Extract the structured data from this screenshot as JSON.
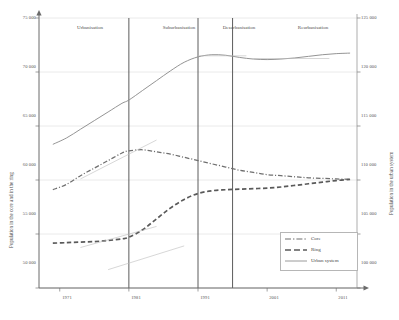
{
  "chart_data": {
    "type": "line",
    "title": "",
    "xlabel": "",
    "x_ticks": [
      "1971",
      "1981",
      "1991",
      "2001",
      "2011"
    ],
    "x_values": [
      1971,
      1981,
      1991,
      2001,
      2011
    ],
    "xlim": [
      1968,
      2014
    ],
    "grid": true,
    "legend_position": "inside-bottom-right",
    "axes": {
      "left": {
        "label": "Population in the core and in the ring",
        "ticks": [
          "50 000",
          "55 000",
          "60 000",
          "65 000",
          "70 000",
          "75 000"
        ],
        "tick_values": [
          50000,
          55000,
          60000,
          65000,
          70000,
          75000
        ],
        "ylim": [
          50000,
          75000
        ]
      },
      "right": {
        "label": "Population in the urban system",
        "ticks": [
          "100 000",
          "105 000",
          "110 000",
          "115 000",
          "120 000",
          "125 000"
        ],
        "tick_values": [
          100000,
          105000,
          110000,
          115000,
          120000,
          125000
        ],
        "ylim": [
          100000,
          125000
        ]
      }
    },
    "phases": [
      {
        "name": "Urbanisation",
        "start": 1968,
        "end": 1981
      },
      {
        "name": "Suburbanisation",
        "start": 1981,
        "end": 1991
      },
      {
        "name": "Desurbanisation",
        "start": 1991,
        "end": 1996
      },
      {
        "name": "Reurbanisation",
        "start": 1996,
        "end": 2014
      }
    ],
    "phase_dividers": [
      1981,
      1991,
      1996
    ],
    "series": [
      {
        "name": "Core",
        "axis": "left",
        "style": "dash-dot",
        "color": "#6f6f6f",
        "x": [
          1970,
          1972,
          1974,
          1976,
          1978,
          1980,
          1981,
          1983,
          1985,
          1987,
          1989,
          1991,
          1993,
          1995,
          1997,
          1999,
          2001,
          2003,
          2005,
          2007,
          2009,
          2011,
          2013
        ],
        "values": [
          59100,
          59600,
          60400,
          61100,
          61800,
          62500,
          62700,
          62800,
          62600,
          62400,
          62100,
          61800,
          61500,
          61200,
          60900,
          60700,
          60500,
          60400,
          60300,
          60200,
          60150,
          60100,
          60050
        ]
      },
      {
        "name": "Ring",
        "axis": "left",
        "style": "dashed",
        "color": "#5a5a5a",
        "x": [
          1970,
          1972,
          1974,
          1976,
          1978,
          1980,
          1981,
          1983,
          1985,
          1987,
          1989,
          1991,
          1993,
          1995,
          1997,
          1999,
          2001,
          2003,
          2005,
          2007,
          2009,
          2011,
          2013
        ],
        "values": [
          54150,
          54200,
          54250,
          54300,
          54400,
          54550,
          54700,
          55400,
          56400,
          57400,
          58200,
          58750,
          59000,
          59100,
          59150,
          59200,
          59250,
          59350,
          59500,
          59650,
          59800,
          59950,
          60050
        ]
      },
      {
        "name": "Urban system",
        "axis": "right",
        "style": "solid",
        "color": "#8e8e8e",
        "x": [
          1970,
          1972,
          1974,
          1976,
          1978,
          1980,
          1981,
          1983,
          1985,
          1987,
          1989,
          1991,
          1993,
          1995,
          1997,
          1999,
          2001,
          2003,
          2005,
          2007,
          2009,
          2011,
          2013
        ],
        "values": [
          113300,
          113900,
          114700,
          115500,
          116300,
          117100,
          117400,
          118300,
          119200,
          120100,
          120900,
          121400,
          121600,
          121550,
          121350,
          121200,
          121150,
          121200,
          121300,
          121450,
          121600,
          121700,
          121750
        ]
      }
    ],
    "trend_segments": [
      {
        "series": "Urban system",
        "x0": 1991,
        "y0": 121500,
        "x1": 1998,
        "y1": 121500
      },
      {
        "series": "Urban system",
        "x0": 1999,
        "y0": 121250,
        "x1": 2010,
        "y1": 121250
      },
      {
        "series": "Core",
        "x0": 1974,
        "y0": 60100,
        "x1": 1985,
        "y1": 63700
      },
      {
        "series": "Ring",
        "x0": 1974,
        "y0": 53750,
        "x1": 1985,
        "y1": 55700
      },
      {
        "series": "Ring",
        "x0": 1978,
        "y0": 51700,
        "x1": 1989,
        "y1": 53900
      }
    ]
  },
  "legend": {
    "items": [
      {
        "label": "Core",
        "style": "dash-dot"
      },
      {
        "label": "Ring",
        "style": "dashed"
      },
      {
        "label": "Urban system",
        "style": "solid"
      }
    ]
  }
}
